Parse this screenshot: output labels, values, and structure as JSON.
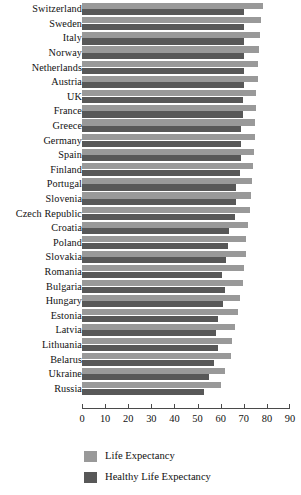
{
  "chart_data": {
    "type": "bar",
    "orientation": "horizontal",
    "title": "",
    "xlabel": "",
    "ylabel": "",
    "xlim": [
      0,
      90
    ],
    "xticks": [
      0,
      10,
      20,
      30,
      40,
      50,
      60,
      70,
      80,
      90
    ],
    "grid": false,
    "legend_position": "bottom-left",
    "categories": [
      "Switzerland",
      "Sweden",
      "Italy",
      "Norway",
      "Netherlands",
      "Austria",
      "UK",
      "France",
      "Greece",
      "Germany",
      "Spain",
      "Finland",
      "Portugal",
      "Slovenia",
      "Czech Republic",
      "Croatia",
      "Poland",
      "Slovakia",
      "Romania",
      "Bulgaria",
      "Hungary",
      "Estonia",
      "Latvia",
      "Lithuania",
      "Belarus",
      "Ukraine",
      "Russia"
    ],
    "series": [
      {
        "name": "Life Expectancy",
        "color": "#999999",
        "values": [
          78.5,
          77.5,
          77.0,
          76.5,
          76.0,
          76.0,
          75.5,
          75.5,
          75.0,
          75.0,
          74.5,
          74.0,
          73.5,
          73.0,
          72.5,
          72.0,
          71.0,
          71.0,
          70.0,
          69.5,
          68.5,
          67.5,
          66.0,
          65.0,
          64.5,
          62.0,
          60.0
        ]
      },
      {
        "name": "Healthy Life Expectancy",
        "color": "#585858",
        "values": [
          70.0,
          70.0,
          70.0,
          70.0,
          70.0,
          70.0,
          69.5,
          69.5,
          69.0,
          69.0,
          69.0,
          68.5,
          66.5,
          66.5,
          66.0,
          63.5,
          63.0,
          62.5,
          60.5,
          62.0,
          61.0,
          59.0,
          58.0,
          59.0,
          57.0,
          55.0,
          53.0
        ]
      }
    ]
  },
  "legend": {
    "items": [
      {
        "label": "Life Expectancy",
        "color": "#999999"
      },
      {
        "label": "Healthy Life Expectancy",
        "color": "#585858"
      }
    ]
  }
}
